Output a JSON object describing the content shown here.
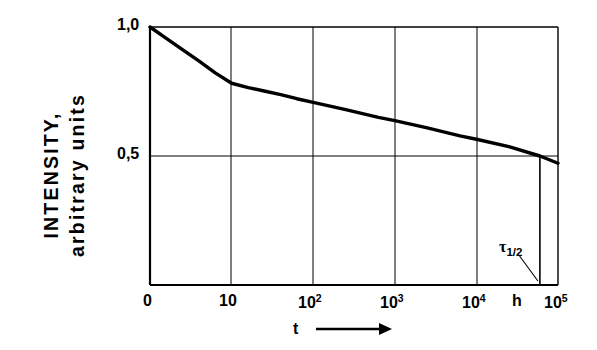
{
  "chart_data": {
    "type": "line",
    "title": "",
    "subtitle": "",
    "xlabel": "t",
    "xlabel_arrow": "⟶",
    "ylabel_line1": "INTENSITY,",
    "ylabel_line2": "arbitrary units",
    "x_unit": "h",
    "x_scale": "log",
    "xlim": [
      1,
      100000
    ],
    "ylim": [
      0,
      1.0
    ],
    "grid": true,
    "legend": "none",
    "x_ticks": [
      {
        "value": 0,
        "label": "0",
        "sup": ""
      },
      {
        "value": 10,
        "label": "10",
        "sup": ""
      },
      {
        "value": 100,
        "label": "10",
        "sup": "2"
      },
      {
        "value": 1000,
        "label": "10",
        "sup": "3"
      },
      {
        "value": 10000,
        "label": "10",
        "sup": "4"
      },
      {
        "value": 100000,
        "label": "10",
        "sup": "5"
      }
    ],
    "y_ticks": [
      {
        "value": 1.0,
        "label": "1,0"
      },
      {
        "value": 0.5,
        "label": "0,5"
      }
    ],
    "series": [
      {
        "name": "intensity-decay",
        "color": "#000000",
        "x": [
          1,
          1.6,
          2.5,
          4,
          6.3,
          10,
          16,
          25,
          40,
          63,
          100,
          250,
          630,
          1000,
          2500,
          6300,
          10000,
          25000,
          60000,
          100000
        ],
        "y": [
          1.0,
          0.955,
          0.912,
          0.868,
          0.822,
          0.782,
          0.765,
          0.752,
          0.738,
          0.722,
          0.708,
          0.68,
          0.65,
          0.637,
          0.609,
          0.578,
          0.565,
          0.536,
          0.5,
          0.472
        ]
      }
    ],
    "annotations": [
      {
        "name": "half-life-marker",
        "label": "τ",
        "subscript": "1/2",
        "x": 60000,
        "y": 0.5,
        "description": "vertical drop line from curve at half intensity down to x-axis with leader line"
      }
    ]
  }
}
